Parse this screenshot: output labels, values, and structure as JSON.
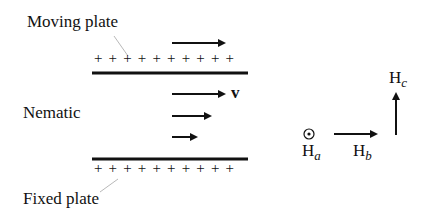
{
  "labels": {
    "moving_plate": "Moving plate",
    "nematic": "Nematic",
    "fixed_plate": "Fixed plate",
    "velocity": "v"
  },
  "fields": {
    "ha": {
      "base": "H",
      "sub": "a"
    },
    "hb": {
      "base": "H",
      "sub": "b"
    },
    "hc": {
      "base": "H",
      "sub": "c"
    }
  },
  "plates": {
    "top_charges": "+ + + + + + + + + +",
    "bottom_charges": "+ + + + + + + + + +"
  }
}
